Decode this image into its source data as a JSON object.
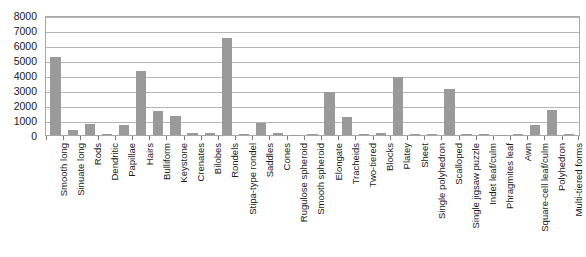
{
  "chart_data": {
    "type": "bar",
    "title": "",
    "subtitle": "",
    "xlabel": "",
    "ylabel": "",
    "ylim": [
      0,
      8000
    ],
    "ytick_step": 1000,
    "yticks": [
      0,
      1000,
      2000,
      3000,
      4000,
      5000,
      6000,
      7000,
      8000
    ],
    "grid": true,
    "legend": "none",
    "bar_color": "#9a9a9a",
    "axis_color": "#a8a8a8",
    "gridline_color": "#b5b5b5",
    "categories": [
      "Smooth long",
      "Sinuate long",
      "Rods",
      "Dendritic",
      "Papillae",
      "Hairs",
      "Bulliform",
      "Keystone",
      "Crenates",
      "Bilobes",
      "Rondels",
      "Stipa-type rondel",
      "Saddles",
      "Cones",
      "Rugulose spheroid",
      "Smooth spheroid",
      "Elongate",
      "Tracheids",
      "Two-tiered",
      "Blocks",
      "Platey",
      "Sheet",
      "Single polyhedron",
      "Scalloped",
      "Single jigsaw puzzle",
      "Indet leaf/culm",
      "Phragmites leaf",
      "Awn",
      "Square-cell leaf/culm",
      "Polyhedron",
      "Multi-tiered forms"
    ],
    "values": [
      5200,
      350,
      750,
      40,
      650,
      4250,
      1600,
      1300,
      140,
      130,
      6500,
      80,
      800,
      120,
      30,
      40,
      2900,
      1200,
      60,
      140,
      3900,
      60,
      40,
      3100,
      40,
      50,
      30,
      40,
      700,
      1700,
      60
    ]
  }
}
